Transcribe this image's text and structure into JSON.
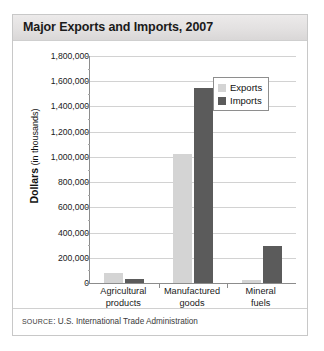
{
  "figure": {
    "title": "Major Exports and Imports, 2007",
    "source_prefix": "SOURCE",
    "source_separator": ": ",
    "source_text": "U.S. International Trade Administration"
  },
  "legend": {
    "position": "top-right",
    "entries": [
      {
        "label": "Exports",
        "color": "#d4d4d4"
      },
      {
        "label": "Imports",
        "color": "#5b5b5b"
      }
    ]
  },
  "axis": {
    "y_title_strong": "Dollars",
    "y_title_light": " (in thousands)",
    "y_tick_labels": [
      "1,800,000",
      "1,600,000",
      "1,400,000",
      "1,200,000",
      "1,000,000",
      "800,000",
      "600,000",
      "400,000",
      "200,000",
      "0"
    ]
  },
  "chart_data": {
    "type": "bar",
    "title": "Major Exports and Imports, 2007",
    "xlabel": "",
    "ylabel": "Dollars (in thousands)",
    "ylim": [
      0,
      1800000
    ],
    "ytick_interval": 200000,
    "grid": true,
    "legend_position": "top-right",
    "categories": [
      "Agricultural products",
      "Manufactured goods",
      "Mineral fuels"
    ],
    "category_lines": [
      [
        "Agricultural",
        "products"
      ],
      [
        "Manufactured",
        "goods"
      ],
      [
        "Mineral",
        "fuels"
      ]
    ],
    "series": [
      {
        "name": "Exports",
        "color": "#d4d4d4",
        "values": [
          80000,
          1020000,
          25000
        ]
      },
      {
        "name": "Imports",
        "color": "#5b5b5b",
        "values": [
          30000,
          1550000,
          290000
        ]
      }
    ]
  }
}
